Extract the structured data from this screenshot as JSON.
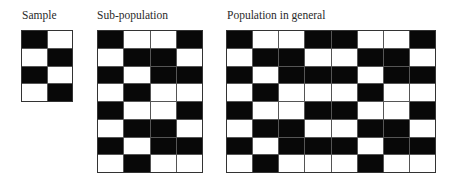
{
  "panels": [
    {
      "id": "sample",
      "label": "Sample",
      "cols": 2,
      "rows": 4,
      "box": {
        "left": 21,
        "top": 30,
        "width": 52,
        "height": 72
      },
      "label_pos": {
        "left": 22,
        "top": 10
      },
      "cells": [
        [
          1,
          0
        ],
        [
          0,
          1
        ],
        [
          1,
          0
        ],
        [
          0,
          1
        ]
      ]
    },
    {
      "id": "sub-population",
      "label": "Sub-population",
      "cols": 4,
      "rows": 8,
      "box": {
        "left": 97,
        "top": 30,
        "width": 106,
        "height": 143
      },
      "label_pos": {
        "left": 97,
        "top": 10
      },
      "cells": [
        [
          1,
          0,
          0,
          1
        ],
        [
          0,
          1,
          1,
          0
        ],
        [
          1,
          0,
          1,
          1
        ],
        [
          0,
          1,
          0,
          0
        ],
        [
          1,
          0,
          0,
          1
        ],
        [
          0,
          1,
          1,
          0
        ],
        [
          1,
          0,
          1,
          1
        ],
        [
          0,
          1,
          0,
          0
        ]
      ]
    },
    {
      "id": "population",
      "label": "Population in general",
      "cols": 8,
      "rows": 8,
      "box": {
        "left": 226,
        "top": 30,
        "width": 210,
        "height": 143
      },
      "label_pos": {
        "left": 227,
        "top": 10
      },
      "cells": [
        [
          1,
          0,
          0,
          1,
          1,
          0,
          0,
          1
        ],
        [
          0,
          1,
          1,
          0,
          0,
          1,
          1,
          0
        ],
        [
          1,
          0,
          1,
          1,
          1,
          0,
          1,
          1
        ],
        [
          0,
          1,
          0,
          0,
          0,
          1,
          0,
          0
        ],
        [
          1,
          0,
          0,
          1,
          1,
          0,
          0,
          1
        ],
        [
          0,
          1,
          1,
          0,
          0,
          1,
          1,
          0
        ],
        [
          1,
          0,
          1,
          1,
          1,
          0,
          1,
          1
        ],
        [
          0,
          1,
          0,
          0,
          0,
          1,
          0,
          0
        ]
      ]
    }
  ],
  "colors": {
    "filled": "#080808",
    "empty": "#ffffff",
    "grid_line": "#555555",
    "label": "#2a2a2a"
  }
}
